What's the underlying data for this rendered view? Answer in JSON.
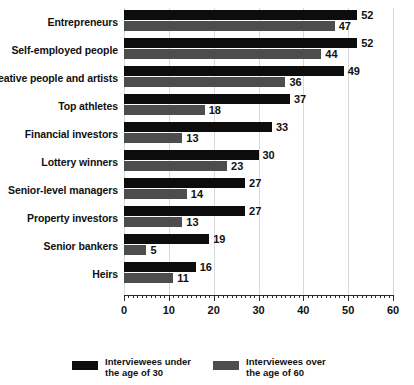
{
  "chart_data": {
    "type": "bar",
    "orientation": "horizontal",
    "title": "",
    "subtitle": "",
    "xlabel": "",
    "ylabel": "",
    "xlim": [
      0,
      60
    ],
    "xticks": [
      0,
      10,
      20,
      30,
      40,
      50,
      60
    ],
    "xtick_labels": [
      "0",
      "10",
      "20",
      "30",
      "40",
      "50",
      "60"
    ],
    "minor_tick_step": 1,
    "grid": true,
    "grid_axis": "x",
    "legend_position": "bottom",
    "categories": [
      "Entrepreneurs",
      "Self-employed people",
      "Creative people and artists",
      "Top athletes",
      "Financial investors",
      "Lottery winners",
      "Senior-level managers",
      "Property investors",
      "Senior bankers",
      "Heirs"
    ],
    "series": [
      {
        "name": "Interviewees under\nthe age of 30",
        "color": "#0d0d0d",
        "values": [
          52,
          52,
          49,
          37,
          33,
          30,
          27,
          27,
          19,
          16
        ]
      },
      {
        "name": "Interviewees over\nthe age of 60",
        "color": "#4d4d4d",
        "values": [
          47,
          44,
          36,
          18,
          13,
          23,
          14,
          13,
          5,
          11
        ]
      }
    ]
  },
  "legend": {
    "items": [
      {
        "label": "Interviewees under\nthe age of 30",
        "color": "#0d0d0d"
      },
      {
        "label": "Interviewees over\nthe age of 60",
        "color": "#4d4d4d"
      }
    ]
  },
  "colors": {
    "series_under_30": "#0d0d0d",
    "series_over_60": "#4d4d4d",
    "axis": "#2b2b2b",
    "gridline": "#d8d8d8",
    "text": "#111111",
    "background": "#ffffff"
  }
}
